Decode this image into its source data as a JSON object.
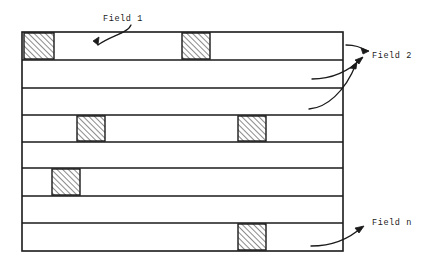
{
  "diagram": {
    "colors": {
      "line": "#1a1a1a",
      "background": "#ffffff",
      "hatch": "#1a1a1a",
      "text": "#1a1a1a"
    },
    "frame": {
      "x": 22,
      "y": 32,
      "width": 321,
      "height": 219,
      "stroke_width": 1.6
    },
    "row_dividers_y": [
      60,
      88,
      115,
      142,
      168,
      196,
      223
    ],
    "rows": [
      {
        "index": 1,
        "y": 32,
        "height": 28,
        "blocks": [
          {
            "x": 24,
            "width": 30
          },
          {
            "x": 182,
            "width": 28
          }
        ]
      },
      {
        "index": 2,
        "y": 60,
        "height": 28,
        "blocks": []
      },
      {
        "index": 3,
        "y": 88,
        "height": 27,
        "blocks": []
      },
      {
        "index": 4,
        "y": 115,
        "height": 27,
        "blocks": [
          {
            "x": 77,
            "width": 28
          },
          {
            "x": 238,
            "width": 28
          }
        ]
      },
      {
        "index": 5,
        "y": 142,
        "height": 26,
        "blocks": []
      },
      {
        "index": 6,
        "y": 168,
        "height": 28,
        "blocks": [
          {
            "x": 52,
            "width": 28
          }
        ]
      },
      {
        "index": 7,
        "y": 196,
        "height": 27,
        "blocks": []
      },
      {
        "index": 8,
        "y": 223,
        "height": 28,
        "blocks": [
          {
            "x": 238,
            "width": 28
          }
        ]
      }
    ],
    "labels": [
      {
        "id": "field-1",
        "text": "Field 1",
        "x": 103,
        "y": 21,
        "anchor": "start"
      },
      {
        "id": "field-2",
        "text": "Field 2",
        "x": 372,
        "y": 58,
        "anchor": "start"
      },
      {
        "id": "field-n",
        "text": "Field n",
        "x": 372,
        "y": 225,
        "anchor": "start"
      }
    ],
    "arrows": [
      {
        "id": "arrow-field-1",
        "label": "Field 1",
        "path": "M 131 25 C 128 33, 110 36, 98 45",
        "tip": "M 98 45 L 99 37 L 93 41 Z"
      },
      {
        "id": "arrow-field-2-row-1",
        "label": "Field 2",
        "path": "M 346 45 C 355 45, 360 47, 368 51",
        "tip": "M 369 51 L 361 48 L 363 54 Z"
      },
      {
        "id": "arrow-field-2-row-2",
        "label": "Field 2",
        "path": "M 312 79 C 331 79, 348 72, 362 58",
        "tip": "M 363 57 L 355 60 L 359 64 Z"
      },
      {
        "id": "arrow-field-2-row-3",
        "label": "Field 2",
        "path": "M 309 109 C 326 108, 345 92, 356 64",
        "tip": "M 357 62 L 350 68 L 356 69 Z"
      },
      {
        "id": "arrow-field-n",
        "label": "Field n",
        "path": "M 311 246 C 330 246, 348 240, 362 227",
        "tip": "M 364 226 L 355 228 L 359 233 Z"
      }
    ]
  }
}
